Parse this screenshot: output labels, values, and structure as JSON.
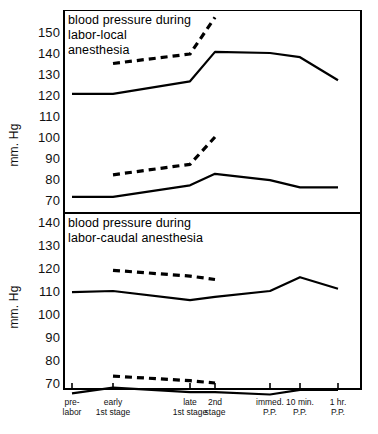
{
  "figure": {
    "ylabel_top": "mm. Hg",
    "ylabel_bottom": "mm. Hg"
  },
  "panels": [
    {
      "title": "blood pressure during\nlabor-local\nanesthesia",
      "yticks": [
        "150",
        "140",
        "130",
        "120",
        "110",
        "100",
        "90",
        "80",
        "70"
      ]
    },
    {
      "title": "blood pressure during\nlabor-caudal anesthesia",
      "yticks": [
        "140",
        "130",
        "120",
        "110",
        "100",
        "90",
        "80",
        "70"
      ]
    }
  ],
  "xlabels": [
    "pre-\nlabor",
    "early\n1st stage",
    "late\n1st stage",
    "2nd\nstage",
    "immed.\nP.P.",
    "10 min.\nP.P.",
    "1 hr.\nP.P."
  ],
  "chart_data": [
    {
      "type": "line",
      "title": "blood pressure during labor-local anesthesia",
      "xlabel": "",
      "ylabel": "mm. Hg",
      "ylim": [
        66,
        157
      ],
      "grid": false,
      "legend": "none",
      "categories": [
        "pre-labor",
        "early 1st stage",
        "late 1st stage",
        "2nd stage",
        "immed. P.P.",
        "10 min. P.P.",
        "1 hr. P.P."
      ],
      "series": [
        {
          "name": "systolic (mean, solid)",
          "style": "solid",
          "values": [
            120.5,
            120.5,
            126.5,
            140.5,
            140.0,
            138.0,
            127.0
          ]
        },
        {
          "name": "systolic (peak, dashed)",
          "style": "dashed",
          "values": [
            null,
            135.0,
            139.5,
            157.0,
            null,
            null,
            null
          ]
        },
        {
          "name": "diastolic (mean, solid)",
          "style": "solid",
          "values": [
            71.5,
            71.5,
            77.0,
            82.5,
            79.5,
            76.0,
            76.0
          ]
        },
        {
          "name": "diastolic (peak, dashed)",
          "style": "dashed",
          "values": [
            null,
            82.0,
            87.0,
            100.0,
            null,
            null,
            null
          ]
        }
      ]
    },
    {
      "type": "line",
      "title": "blood pressure during labor-caudal anesthesia",
      "xlabel": "",
      "ylabel": "mm. Hg",
      "ylim": [
        62,
        145
      ],
      "grid": false,
      "legend": "none",
      "categories": [
        "pre-labor",
        "early 1st stage",
        "late 1st stage",
        "2nd stage",
        "immed. P.P.",
        "10 min. P.P.",
        "1 hr. P.P."
      ],
      "series": [
        {
          "name": "systolic (mean, solid)",
          "style": "solid",
          "values": [
            109.5,
            110.0,
            106.0,
            107.5,
            110.0,
            116.0,
            111.0
          ]
        },
        {
          "name": "systolic (peak, dashed)",
          "style": "dashed",
          "values": [
            null,
            119.0,
            116.5,
            115.0,
            null,
            null,
            null
          ]
        },
        {
          "name": "diastolic (mean, solid)",
          "style": "solid",
          "values": [
            65.5,
            68.0,
            66.0,
            66.0,
            65.0,
            67.0,
            67.0
          ]
        },
        {
          "name": "diastolic (peak, dashed)",
          "style": "dashed",
          "values": [
            null,
            73.0,
            71.0,
            70.0,
            null,
            null,
            null
          ]
        }
      ]
    }
  ]
}
